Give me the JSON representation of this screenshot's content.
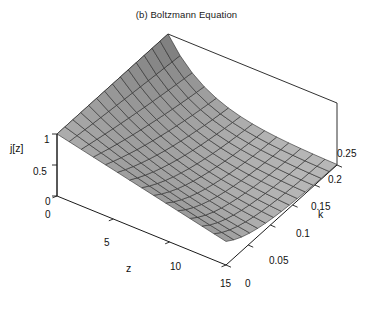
{
  "figure": {
    "title": "(b) Boltzmann Equation",
    "background": "#ffffff",
    "width": 373,
    "height": 311
  },
  "chart_data": {
    "type": "surface",
    "title": "(b) Boltzmann Equation",
    "xlabel": "z",
    "ylabel": "k",
    "zlabel": "j[z]",
    "xlim": [
      0,
      15
    ],
    "ylim": [
      0,
      0.25
    ],
    "zlim": [
      0,
      1
    ],
    "xticks": [
      "0",
      "5",
      "10",
      "15"
    ],
    "xtick_values": [
      0,
      5,
      10,
      15
    ],
    "yticks": [
      "0",
      "0.05",
      "0.1",
      "0.15",
      "0.2",
      "0.25"
    ],
    "ytick_values": [
      0,
      0.05,
      0.1,
      0.15,
      0.2,
      0.25
    ],
    "zticks": [
      "0",
      "0.5",
      "1"
    ],
    "ztick_values": [
      0,
      0.5,
      1
    ],
    "grid": false,
    "legend": "none",
    "mesh_cells_x": 14,
    "mesh_cells_y": 14,
    "surface_fill": "#b9b9b9",
    "surface_fill_shadow": "#7d7d7d",
    "mesh_line_color": "#2a2a2a",
    "box_line_color": "#1a1a1a",
    "z_of": "j(z,k) = exp(-k*z) * (1 - 0.62*z/15)"
  },
  "ticks": {
    "vertical": [
      {
        "label": "1",
        "x": 44,
        "y": 134
      },
      {
        "label": "0.5",
        "x": 33,
        "y": 166
      },
      {
        "label": "0",
        "x": 45,
        "y": 196
      }
    ],
    "z_axis": [
      {
        "label": "0",
        "x": 45,
        "y": 209
      },
      {
        "label": "5",
        "x": 104,
        "y": 237
      },
      {
        "label": "10",
        "x": 170,
        "y": 261
      },
      {
        "label": "15",
        "x": 220,
        "y": 278
      }
    ],
    "k_axis": [
      {
        "label": "0",
        "x": 245,
        "y": 278
      },
      {
        "label": "0.05",
        "x": 269,
        "y": 255
      },
      {
        "label": "0.1",
        "x": 296,
        "y": 228
      },
      {
        "label": "0.15",
        "x": 311,
        "y": 201
      },
      {
        "label": "0.2",
        "x": 328,
        "y": 174
      },
      {
        "label": "0.25",
        "x": 337,
        "y": 148
      }
    ]
  },
  "axis_labels": {
    "z": {
      "text": "z",
      "x": 126,
      "y": 262
    },
    "k": {
      "text": "k",
      "x": 318,
      "y": 208
    },
    "jofz": {
      "text": "j[z]",
      "x": 10,
      "y": 142
    }
  }
}
